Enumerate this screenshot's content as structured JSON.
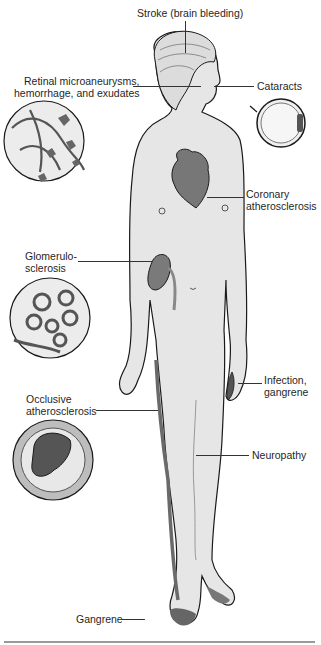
{
  "diagram": {
    "labels": {
      "stroke": "Stroke (brain bleeding)",
      "retinal_line1": "Retinal microaneurysms,",
      "retinal_line2": "hemorrhage, and exudates",
      "cataracts": "Cataracts",
      "coronary_line1": "Coronary",
      "coronary_line2": "atherosclerosis",
      "glomerulo_line1": "Glomerulo-",
      "glomerulo_line2": "sclerosis",
      "infection_line1": "Infection,",
      "infection_line2": "gangrene",
      "occlusive_line1": "Occlusive",
      "occlusive_line2": "atherosclerosis",
      "neuropathy": "Neuropathy",
      "gangrene": "Gangrene"
    },
    "insets": [
      "retina-vessels",
      "eye-cross-section",
      "glomerulus",
      "occluded-artery"
    ],
    "colors": {
      "skin": "#e6e6e6",
      "outline": "#1a1a1a",
      "organ": "#7a7a7a",
      "organ_dark": "#555555",
      "inset_bg": "#ececec",
      "rule": "#9a9a9a"
    }
  }
}
